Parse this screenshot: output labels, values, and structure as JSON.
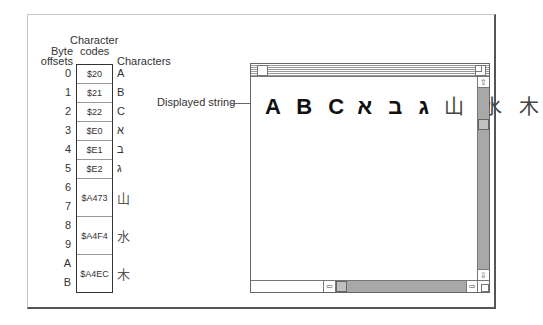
{
  "headers": {
    "byte_offsets_1": "Byte",
    "byte_offsets_2": "offsets",
    "character_codes_1": "Character",
    "character_codes_2": "codes",
    "characters": "Characters"
  },
  "offsets": [
    "0",
    "1",
    "2",
    "3",
    "4",
    "5",
    "6",
    "7",
    "8",
    "9",
    "A",
    "B"
  ],
  "codes": [
    "$20",
    "$21",
    "$22",
    "$E0",
    "$E1",
    "$E2",
    "$A473",
    "$A4F4",
    "$A4EC"
  ],
  "characters": [
    "A",
    "B",
    "C",
    "א",
    "ב",
    "ג",
    "山",
    "水",
    "木"
  ],
  "callout_label": "Displayed string",
  "window": {
    "displayed_latin": "A B C",
    "displayed_hebrew": "ג ב א",
    "displayed_cjk": "山 水 木",
    "scroll_up_icon": "⇧",
    "scroll_down_icon": "⇩",
    "scroll_left_icon": "⇦",
    "scroll_right_icon": "⇨"
  }
}
